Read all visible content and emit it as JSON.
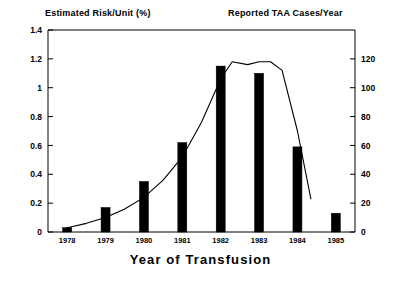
{
  "figure": {
    "left_axis_header": "Estimated Risk/Unit (%)",
    "right_axis_header": "Reported TAA Cases/Year",
    "xaxis_title": "Year of Transfusion"
  },
  "chart_data": {
    "type": "bar",
    "title": "",
    "xlabel": "Year of Transfusion",
    "ylabel": "Reported TAA Cases/Year",
    "y2label": "Estimated Risk/Unit (%)",
    "categories": [
      "1978",
      "1979",
      "1980",
      "1981",
      "1982",
      "1983",
      "1984",
      "1985"
    ],
    "values": [
      3,
      17,
      35,
      62,
      115,
      110,
      59,
      13
    ],
    "ylim": [
      0,
      140
    ],
    "yticks": [
      0,
      20,
      40,
      60,
      80,
      100,
      120
    ],
    "ytick_labels": [
      "0",
      "20",
      "40",
      "60",
      "80",
      "100",
      "120"
    ],
    "y2lim": [
      0,
      1.4
    ],
    "y2ticks": [
      0,
      0.2,
      0.4,
      0.6,
      0.8,
      1,
      1.2,
      1.4
    ],
    "y2tick_labels": [
      "0",
      "0.2",
      "0.4",
      "0.6",
      "0.8",
      "1",
      "1.2",
      "1.4"
    ],
    "grid": false,
    "legend": "none",
    "bar_color": "#000000",
    "line_color": "#000000",
    "series": [
      {
        "name": "Reported TAA Cases/Year",
        "type": "bar",
        "axis": "right",
        "values": [
          3,
          17,
          35,
          62,
          115,
          110,
          59,
          13
        ]
      },
      {
        "name": "Estimated Risk/Unit (%)",
        "type": "line",
        "axis": "left",
        "x": [
          1978.0,
          1978.5,
          1979.0,
          1979.5,
          1980.0,
          1980.5,
          1981.0,
          1981.5,
          1982.0,
          1982.3,
          1982.7,
          1983.0,
          1983.3,
          1983.6,
          1984.0,
          1984.35
        ],
        "values": [
          0.03,
          0.06,
          0.1,
          0.16,
          0.24,
          0.36,
          0.52,
          0.76,
          1.06,
          1.18,
          1.16,
          1.18,
          1.18,
          1.12,
          0.7,
          0.23
        ]
      }
    ]
  }
}
